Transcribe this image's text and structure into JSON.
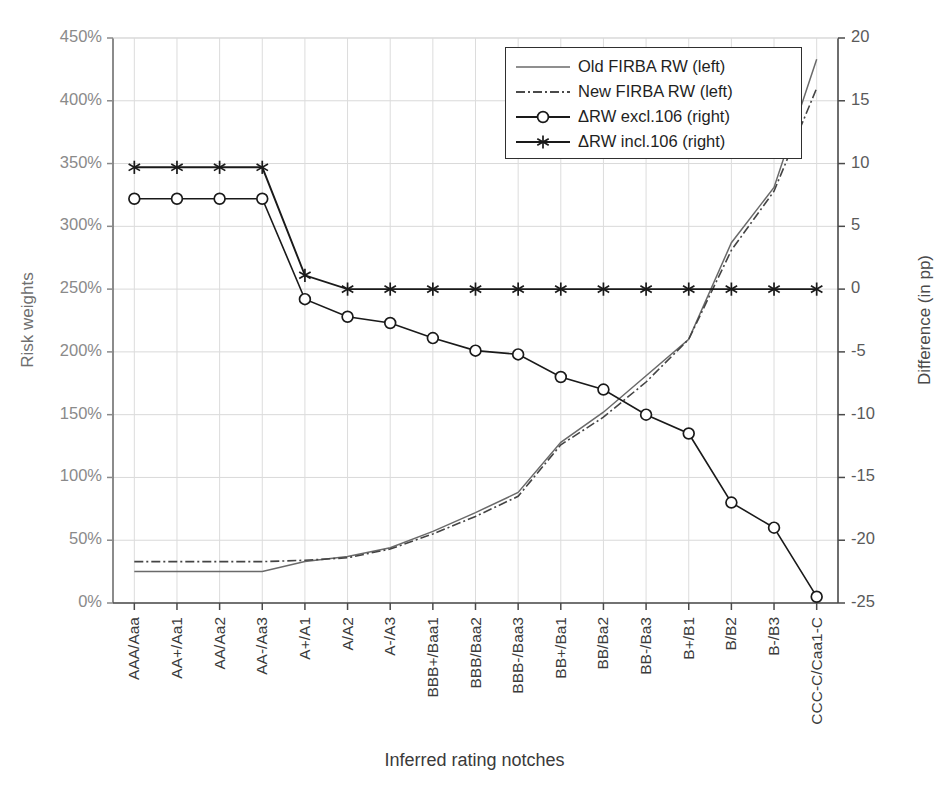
{
  "axes": {
    "y_left_title": "Risk weights",
    "y_right_title": "Difference (in pp)",
    "x_title": "Inferred rating notches",
    "y_left_ticks": [
      "0%",
      "50%",
      "100%",
      "150%",
      "200%",
      "250%",
      "300%",
      "350%",
      "400%",
      "450%"
    ],
    "y_right_ticks": [
      "-25",
      "-20",
      "-15",
      "-10",
      "-5",
      "0",
      "5",
      "10",
      "15",
      "20"
    ]
  },
  "legend": {
    "items": [
      {
        "label": "Old FIRBA RW (left)",
        "style": "solid-thin",
        "marker": "none",
        "color": "#6a6a6a"
      },
      {
        "label": "New FIRBA RW (left)",
        "style": "dash-dot",
        "marker": "none",
        "color": "#4a4a4a"
      },
      {
        "label": "ΔRW excl.106 (right)",
        "style": "solid",
        "marker": "circle",
        "color": "#1a1a1a"
      },
      {
        "label": "ΔRW incl.106 (right)",
        "style": "solid",
        "marker": "asterisk",
        "color": "#1a1a1a"
      }
    ]
  },
  "chart_data": {
    "type": "line",
    "title": "",
    "xlabel": "Inferred rating notches",
    "ylabel": "Risk weights",
    "ylabel_right": "Difference (in pp)",
    "grid": true,
    "legend_position": "top-center-right",
    "ylim": [
      0,
      450
    ],
    "ylim_right": [
      -25,
      20
    ],
    "y_tick_step": 50,
    "y_right_tick_step": 5,
    "categories": [
      "AAA/Aaa",
      "AA+/Aa1",
      "AA/Aa2",
      "AA-/Aa3",
      "A+/A1",
      "A/A2",
      "A-/A3",
      "BBB+/Baa1",
      "BBB/Baa2",
      "BBB-/Baa3",
      "BB+/Ba1",
      "BB/Ba2",
      "BB-/Ba3",
      "B+/B1",
      "B/B2",
      "B-/B3",
      "CCC-C/Caa1-C"
    ],
    "series": [
      {
        "name": "Old FIRBA RW (left)",
        "axis": "left",
        "unit": "%",
        "values": [
          25,
          25,
          25,
          25,
          33,
          37,
          44,
          57,
          72,
          88,
          128,
          152,
          181,
          210,
          287,
          331,
          433
        ]
      },
      {
        "name": "New FIRBA RW (left)",
        "axis": "left",
        "unit": "%",
        "values": [
          33,
          33,
          33,
          33,
          34,
          36,
          43,
          55,
          69,
          85,
          126,
          148,
          176,
          210,
          281,
          328,
          410
        ]
      },
      {
        "name": "ΔRW excl.106 (right)",
        "axis": "right",
        "unit": "pp",
        "values": [
          7.2,
          7.2,
          7.2,
          7.2,
          -0.8,
          -2.2,
          -2.7,
          -3.9,
          -4.9,
          -5.2,
          -7.0,
          -8.0,
          -10.0,
          -11.5,
          -17.0,
          -19.0,
          -24.5
        ]
      },
      {
        "name": "ΔRW incl.106 (right)",
        "axis": "right",
        "unit": "pp",
        "values": [
          9.7,
          9.7,
          9.7,
          9.7,
          1.1,
          0.0,
          0.0,
          0.0,
          0.0,
          0.0,
          0.0,
          0.0,
          0.0,
          0.0,
          0.0,
          0.0,
          0.0
        ]
      }
    ]
  }
}
